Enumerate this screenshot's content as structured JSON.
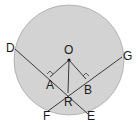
{
  "diagram": {
    "type": "circle-geometry",
    "colors": {
      "circle_fill": "#d3d3d3",
      "circle_stroke": "#a8a8a8",
      "line": "#3a3a3a",
      "text": "#1a1a1a"
    },
    "labels": {
      "O": "O",
      "A": "A",
      "B": "B",
      "R": "R",
      "D": "D",
      "E": "E",
      "F": "F",
      "G": "G"
    },
    "points": {
      "O": [
        69,
        60
      ],
      "A": [
        50,
        77
      ],
      "B": [
        86,
        79
      ],
      "R": [
        68,
        93
      ],
      "D": [
        15,
        49
      ],
      "E": [
        88,
        114
      ],
      "F": [
        48,
        111
      ],
      "G": [
        122,
        57
      ]
    },
    "chords": [
      {
        "name": "DE",
        "from": "D",
        "to": "E"
      },
      {
        "name": "FG",
        "from": "F",
        "to": "G"
      }
    ],
    "segments": [
      {
        "name": "OA",
        "from": "O",
        "to": "A"
      },
      {
        "name": "OB",
        "from": "O",
        "to": "B"
      },
      {
        "name": "OR",
        "from": "O",
        "to": "R"
      }
    ],
    "right_angles": [
      "A",
      "B"
    ]
  }
}
